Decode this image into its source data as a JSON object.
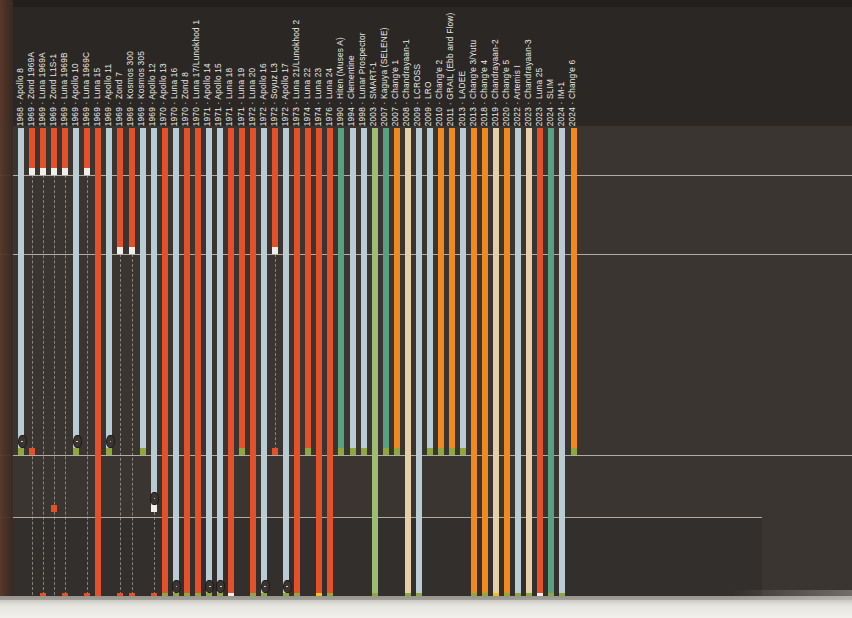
{
  "figure": {
    "type": "timeline-bar-chart",
    "orientation": "vertical-descending",
    "background_color": "#3a3531",
    "page_color": "#2b2725",
    "gridline_color": "#d8d5cd",
    "label_color": "#e9e7e1",
    "label_format": "YEAR · Mission"
  },
  "palette": {
    "orange_red": "#e4502a",
    "pale_blue": "#b9ccd3",
    "teal_green": "#57a182",
    "olive_green": "#9cbd72",
    "orange": "#f08a1e",
    "tan": "#e6cfa8",
    "white_cap": "#f0efe9",
    "olive_cap": "#8ea83e",
    "yellow_cap": "#f0c020",
    "red_cap": "#e4502a"
  },
  "gridlines_y": [
    175,
    254,
    455,
    517
  ],
  "chart_data": {
    "type": "bar",
    "title": "",
    "xlabel": "",
    "ylabel": "",
    "categories": [
      "1968 · Apollo 8",
      "1969 · Zond 1969A",
      "1969 · Luna 1969A",
      "1969 · Zond L1S-1",
      "1969 · Luna 1969B",
      "1969 · Apollo 10",
      "1969 · Luna 1969C",
      "1969 · Luna 15",
      "1969 · Apollo 11",
      "1969 · Zond 7",
      "1969 · Kosmos 300",
      "1969 · Kosmos 305",
      "1969 · Apollo 12",
      "1970 · Apollo 13",
      "1970 · Luna 16",
      "1970 · Zond 8",
      "1970 · Luna 17/Lunokhod 1",
      "1971 · Apollo 14",
      "1971 · Apollo 15",
      "1971 · Luna 18",
      "1971 · Luna 19",
      "1972 · Luna 20",
      "1972 · Apollo 16",
      "1972 · Soyuz L3",
      "1972 · Apollo 17",
      "1973 · Luna 21/Lunokhod 2",
      "1974 · Luna 22",
      "1974 · Luna 23",
      "1976 · Luna 24",
      "1990 · Hiten (Muses A)",
      "1994 · Clementine",
      "1998 · Lunar Prospector",
      "2003 · SMART-1",
      "2007 · Kaguya (SELENE)",
      "2007 · Chang'e 1",
      "2008 · Chandrayaan-1",
      "2009 · LCROSS",
      "2009 · LRO",
      "2010 · Chang'e 2",
      "2011 · GRAIL (Ebb and Flow)",
      "2013 · LADEE",
      "2013 · Chang'e 3/Yutu",
      "2018 · Chang'e 4",
      "2019 · Chandrayaan-2",
      "2020 · Chang'e 5",
      "2022 · Artemis I",
      "2023 · Chandrayaan-3",
      "2023 · Luna 25",
      "2024 · SLIM",
      "2024 · IM-1",
      "2024 · Chang'e 6"
    ],
    "bars": [
      {
        "label": "1968 · Apollo 8",
        "year": "1968",
        "mission": "Apollo 8",
        "color": "pale_blue",
        "end": 455,
        "cap": "olive_cap",
        "lens": true,
        "dash": false
      },
      {
        "label": "1969 · Zond 1969A",
        "year": "1969",
        "mission": "Zond 1969A",
        "color": "orange_red",
        "end": 175,
        "cap": "white_cap",
        "lens": false,
        "dash": true,
        "dash_to": 600,
        "dash_cap": 455
      },
      {
        "label": "1969 · Luna 1969A",
        "year": "1969",
        "mission": "Luna 1969A",
        "color": "orange_red",
        "end": 175,
        "cap": "white_cap",
        "lens": false,
        "dash": true,
        "dash_to": 600,
        "dash_cap": 600
      },
      {
        "label": "1969 · Zond L1S-1",
        "year": "1969",
        "mission": "Zond L1S-1",
        "color": "orange_red",
        "end": 175,
        "cap": "white_cap",
        "lens": false,
        "dash": true,
        "dash_to": 600,
        "dash_cap": 512
      },
      {
        "label": "1969 · Luna 1969B",
        "year": "1969",
        "mission": "Luna 1969B",
        "color": "orange_red",
        "end": 175,
        "cap": "white_cap",
        "lens": false,
        "dash": true,
        "dash_to": 600,
        "dash_cap": 600
      },
      {
        "label": "1969 · Apollo 10",
        "year": "1969",
        "mission": "Apollo 10",
        "color": "pale_blue",
        "end": 455,
        "cap": "olive_cap",
        "lens": true,
        "dash": false
      },
      {
        "label": "1969 · Luna 1969C",
        "year": "1969",
        "mission": "Luna 1969C",
        "color": "orange_red",
        "end": 175,
        "cap": "white_cap",
        "lens": false,
        "dash": true,
        "dash_to": 600,
        "dash_cap": 600
      },
      {
        "label": "1969 · Luna 15",
        "year": "1969",
        "mission": "Luna 15",
        "color": "orange_red",
        "end": 600,
        "cap": "red_cap",
        "lens": false,
        "dash": false
      },
      {
        "label": "1969 · Apollo 11",
        "year": "1969",
        "mission": "Apollo 11",
        "color": "pale_blue",
        "end": 455,
        "cap": "olive_cap",
        "lens": true,
        "dash": false
      },
      {
        "label": "1969 · Zond 7",
        "year": "1969",
        "mission": "Zond 7",
        "color": "orange_red",
        "end": 254,
        "cap": "white_cap",
        "lens": false,
        "dash": true,
        "dash_to": 600,
        "dash_cap": 600
      },
      {
        "label": "1969 · Kosmos 300",
        "year": "1969",
        "mission": "Kosmos 300",
        "color": "orange_red",
        "end": 254,
        "cap": "white_cap",
        "lens": false,
        "dash": true,
        "dash_to": 600,
        "dash_cap": 600
      },
      {
        "label": "1969 · Kosmos 305",
        "year": "1969",
        "mission": "Kosmos 305",
        "color": "pale_blue",
        "end": 455,
        "cap": "olive_cap",
        "lens": false,
        "dash": false
      },
      {
        "label": "1969 · Apollo 12",
        "year": "1969",
        "mission": "Apollo 12",
        "color": "pale_blue",
        "end": 512,
        "cap": "white_cap",
        "lens": true,
        "dash": true,
        "dash_to": 600,
        "dash_cap": 600
      },
      {
        "label": "1970 · Apollo 13",
        "year": "1970",
        "mission": "Apollo 13",
        "color": "orange_red",
        "end": 600,
        "cap": "olive_cap",
        "lens": false,
        "dash": false
      },
      {
        "label": "1970 · Luna 16",
        "year": "1970",
        "mission": "Luna 16",
        "color": "pale_blue",
        "end": 600,
        "cap": "olive_cap",
        "lens": true,
        "dash": false
      },
      {
        "label": "1970 · Zond 8",
        "year": "1970",
        "mission": "Zond 8",
        "color": "orange_red",
        "end": 600,
        "cap": "olive_cap",
        "lens": false,
        "dash": false
      },
      {
        "label": "1970 · Luna 17/Lunokhod 1",
        "year": "1970",
        "mission": "Luna 17/Lunokhod 1",
        "color": "orange_red",
        "end": 600,
        "cap": "olive_cap",
        "lens": false,
        "dash": false
      },
      {
        "label": "1971 · Apollo 14",
        "year": "1971",
        "mission": "Apollo 14",
        "color": "pale_blue",
        "end": 600,
        "cap": "olive_cap",
        "lens": true,
        "dash": false
      },
      {
        "label": "1971 · Apollo 15",
        "year": "1971",
        "mission": "Apollo 15",
        "color": "pale_blue",
        "end": 600,
        "cap": "olive_cap",
        "lens": true,
        "dash": false
      },
      {
        "label": "1971 · Luna 18",
        "year": "1971",
        "mission": "Luna 18",
        "color": "orange_red",
        "end": 600,
        "cap": "white_cap",
        "lens": false,
        "dash": false
      },
      {
        "label": "1971 · Luna 19",
        "year": "1971",
        "mission": "Luna 19",
        "color": "orange_red",
        "end": 455,
        "cap": "olive_cap",
        "lens": false,
        "dash": false
      },
      {
        "label": "1972 · Luna 20",
        "year": "1972",
        "mission": "Luna 20",
        "color": "orange_red",
        "end": 600,
        "cap": "olive_cap",
        "lens": false,
        "dash": false
      },
      {
        "label": "1972 · Apollo 16",
        "year": "1972",
        "mission": "Apollo 16",
        "color": "pale_blue",
        "end": 600,
        "cap": "olive_cap",
        "lens": true,
        "dash": false
      },
      {
        "label": "1972 · Soyuz L3",
        "year": "1972",
        "mission": "Soyuz L3",
        "color": "orange_red",
        "end": 254,
        "cap": "white_cap",
        "lens": false,
        "dash": true,
        "dash_to": 455,
        "dash_cap": 455
      },
      {
        "label": "1972 · Apollo 17",
        "year": "1972",
        "mission": "Apollo 17",
        "color": "pale_blue",
        "end": 600,
        "cap": "olive_cap",
        "lens": true,
        "dash": false
      },
      {
        "label": "1973 · Luna 21/Lunokhod 2",
        "year": "1973",
        "mission": "Luna 21/Lunokhod 2",
        "color": "orange_red",
        "end": 600,
        "cap": "olive_cap",
        "lens": false,
        "dash": false
      },
      {
        "label": "1974 · Luna 22",
        "year": "1974",
        "mission": "Luna 22",
        "color": "orange_red",
        "end": 455,
        "cap": "olive_cap",
        "lens": false,
        "dash": false
      },
      {
        "label": "1974 · Luna 23",
        "year": "1974",
        "mission": "Luna 23",
        "color": "orange_red",
        "end": 600,
        "cap": "yellow_cap",
        "lens": false,
        "dash": false
      },
      {
        "label": "1976 · Luna 24",
        "year": "1976",
        "mission": "Luna 24",
        "color": "orange_red",
        "end": 600,
        "cap": "olive_cap",
        "lens": false,
        "dash": false
      },
      {
        "label": "1990 · Hiten (Muses A)",
        "year": "1990",
        "mission": "Hiten (Muses A)",
        "color": "teal_green",
        "end": 455,
        "cap": "olive_cap",
        "lens": false,
        "dash": false
      },
      {
        "label": "1994 · Clementine",
        "year": "1994",
        "mission": "Clementine",
        "color": "pale_blue",
        "end": 455,
        "cap": "olive_cap",
        "lens": false,
        "dash": false
      },
      {
        "label": "1998 · Lunar Prospector",
        "year": "1998",
        "mission": "Lunar Prospector",
        "color": "pale_blue",
        "end": 455,
        "cap": "olive_cap",
        "lens": false,
        "dash": false
      },
      {
        "label": "2003 · SMART-1",
        "year": "2003",
        "mission": "SMART-1",
        "color": "olive_green",
        "end": 600,
        "cap": "olive_cap",
        "lens": false,
        "dash": false
      },
      {
        "label": "2007 · Kaguya (SELENE)",
        "year": "2007",
        "mission": "Kaguya (SELENE)",
        "color": "teal_green",
        "end": 455,
        "cap": "olive_cap",
        "lens": false,
        "dash": false
      },
      {
        "label": "2007 · Chang'e 1",
        "year": "2007",
        "mission": "Chang'e 1",
        "color": "orange",
        "end": 455,
        "cap": "olive_cap",
        "lens": false,
        "dash": false
      },
      {
        "label": "2008 · Chandrayaan-1",
        "year": "2008",
        "mission": "Chandrayaan-1",
        "color": "tan",
        "end": 600,
        "cap": "olive_cap",
        "lens": false,
        "dash": false
      },
      {
        "label": "2009 · LCROSS",
        "year": "2009",
        "mission": "LCROSS",
        "color": "pale_blue",
        "end": 600,
        "cap": "olive_cap",
        "lens": false,
        "dash": false
      },
      {
        "label": "2009 · LRO",
        "year": "2009",
        "mission": "LRO",
        "color": "pale_blue",
        "end": 455,
        "cap": "olive_cap",
        "lens": false,
        "dash": false
      },
      {
        "label": "2010 · Chang'e 2",
        "year": "2010",
        "mission": "Chang'e 2",
        "color": "orange",
        "end": 455,
        "cap": "olive_cap",
        "lens": false,
        "dash": false
      },
      {
        "label": "2011 · GRAIL (Ebb and Flow)",
        "year": "2011",
        "mission": "GRAIL (Ebb and Flow)",
        "color": "orange",
        "end": 455,
        "cap": "olive_cap",
        "lens": false,
        "dash": false
      },
      {
        "label": "2013 · LADEE",
        "year": "2013",
        "mission": "LADEE",
        "color": "pale_blue",
        "end": 455,
        "cap": "olive_cap",
        "lens": false,
        "dash": false
      },
      {
        "label": "2013 · Chang'e 3/Yutu",
        "year": "2013",
        "mission": "Chang'e 3/Yutu",
        "color": "orange",
        "end": 600,
        "cap": "olive_cap",
        "lens": false,
        "dash": false
      },
      {
        "label": "2018 · Chang'e 4",
        "year": "2018",
        "mission": "Chang'e 4",
        "color": "orange",
        "end": 600,
        "cap": "olive_cap",
        "lens": false,
        "dash": false
      },
      {
        "label": "2019 · Chandrayaan-2",
        "year": "2019",
        "mission": "Chandrayaan-2",
        "color": "tan",
        "end": 600,
        "cap": "yellow_cap",
        "lens": false,
        "dash": false
      },
      {
        "label": "2020 · Chang'e 5",
        "year": "2020",
        "mission": "Chang'e 5",
        "color": "orange",
        "end": 600,
        "cap": "olive_cap",
        "lens": false,
        "dash": false
      },
      {
        "label": "2022 · Artemis I",
        "year": "2022",
        "mission": "Artemis I",
        "color": "pale_blue",
        "end": 600,
        "cap": "olive_cap",
        "lens": false,
        "dash": false
      },
      {
        "label": "2023 · Chandrayaan-3",
        "year": "2023",
        "mission": "Chandrayaan-3",
        "color": "tan",
        "end": 600,
        "cap": "olive_cap",
        "lens": false,
        "dash": false
      },
      {
        "label": "2023 · Luna 25",
        "year": "2023",
        "mission": "Luna 25",
        "color": "orange_red",
        "end": 600,
        "cap": "white_cap",
        "lens": false,
        "dash": false
      },
      {
        "label": "2024 · SLIM",
        "year": "2024",
        "mission": "SLIM",
        "color": "teal_green",
        "end": 600,
        "cap": "olive_cap",
        "lens": false,
        "dash": false
      },
      {
        "label": "2024 · IM-1",
        "year": "2024",
        "mission": "IM-1",
        "color": "pale_blue",
        "end": 600,
        "cap": "olive_cap",
        "lens": false,
        "dash": false
      },
      {
        "label": "2024 · Chang'e 6",
        "year": "2024",
        "mission": "Chang'e 6",
        "color": "orange",
        "end": 455,
        "cap": "olive_cap",
        "lens": false,
        "dash": false
      }
    ]
  }
}
